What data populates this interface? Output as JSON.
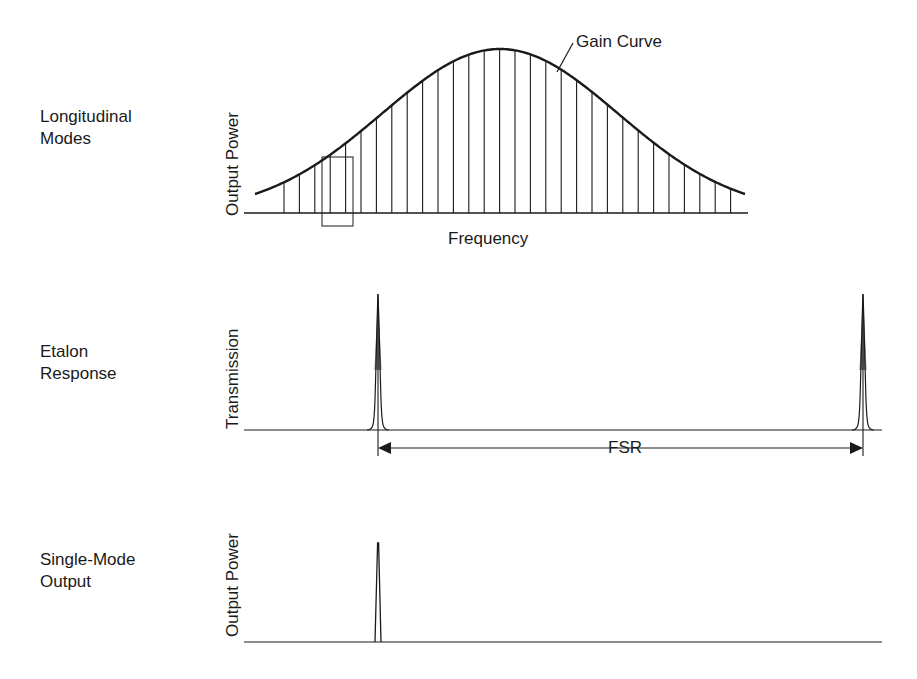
{
  "panels": [
    {
      "id": "longitudinal-modes",
      "row_label_line1": "Longitudinal",
      "row_label_line2": "Modes",
      "y_axis_label": "Output Power",
      "x_axis_label": "Frequency",
      "annotation": "Gain Curve"
    },
    {
      "id": "etalon-response",
      "row_label_line1": "Etalon",
      "row_label_line2": "Response",
      "y_axis_label": "Transmission",
      "annotation": "FSR"
    },
    {
      "id": "single-mode-output",
      "row_label_line1": "Single-Mode",
      "row_label_line2": "Output",
      "y_axis_label": "Output Power"
    }
  ],
  "colors": {
    "ink": "#1a1a1a",
    "background": "#ffffff"
  },
  "chart_data": [
    {
      "type": "line",
      "title": "Longitudinal Modes",
      "xlabel": "Frequency",
      "ylabel": "Output Power",
      "series": [
        {
          "name": "Gain Curve",
          "shape": "gaussian",
          "center_relative": 0.5,
          "peak_relative": 1.0
        },
        {
          "name": "Longitudinal modes",
          "count": 30,
          "spacing": "uniform",
          "heights": "bounded by gain curve"
        }
      ],
      "annotations": [
        "Gain Curve",
        "highlight box around modes 3-5 on the rising edge"
      ],
      "grid": false
    },
    {
      "type": "line",
      "title": "Etalon Response",
      "xlabel": "",
      "ylabel": "Transmission",
      "series": [
        {
          "name": "Etalon transmission peaks",
          "peaks_at_relative_x": [
            0.19,
            0.95
          ],
          "peak_relative": 1.0
        }
      ],
      "annotations": [
        "FSR (free spectral range) arrow between the two peaks"
      ],
      "grid": false
    },
    {
      "type": "line",
      "title": "Single-Mode Output",
      "xlabel": "",
      "ylabel": "Output Power",
      "series": [
        {
          "name": "Single mode",
          "peaks_at_relative_x": [
            0.19
          ],
          "peak_relative": 0.73
        }
      ],
      "grid": false
    }
  ]
}
